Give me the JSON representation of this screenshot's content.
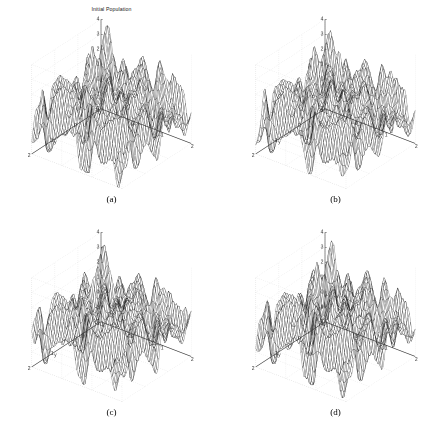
{
  "figure": {
    "background_color": "#ffffff",
    "layout": "2x2-grid",
    "width": 447,
    "height": 426
  },
  "panels": [
    {
      "key": "a",
      "caption": "(a)",
      "title": "Initial Population",
      "has_title": true,
      "seed": 11
    },
    {
      "key": "b",
      "caption": "(b)",
      "title": "",
      "has_title": false,
      "seed": 27
    },
    {
      "key": "c",
      "caption": "(c)",
      "title": "",
      "has_title": false,
      "seed": 43
    },
    {
      "key": "d",
      "caption": "(d)",
      "title": "",
      "has_title": false,
      "seed": 61
    }
  ],
  "chart_data": {
    "type": "line",
    "subtype": "3d-mesh-surface",
    "title": "Initial Population",
    "xlabel": "x",
    "ylabel": "y",
    "zlabel": "",
    "xlim": [
      -1,
      2
    ],
    "ylim": [
      -1,
      2
    ],
    "zlim": [
      -2,
      4
    ],
    "xticks": [
      -1,
      0,
      1,
      2
    ],
    "yticks": [
      -1,
      0,
      1,
      2
    ],
    "zticks": [
      -2,
      -1,
      0,
      1,
      2,
      3,
      4
    ],
    "xtick_labels": [
      "-1",
      "0",
      "1",
      "2"
    ],
    "ytick_labels": [
      "-1",
      "0",
      "1",
      "2"
    ],
    "ztick_labels": [
      "-2",
      "-1",
      "0",
      "1",
      "2",
      "3",
      "4"
    ],
    "grid": true,
    "grid_style": "dotted",
    "grid_color": "#c8c8c8",
    "legend": null,
    "mesh_color": "#000000",
    "surface_fill": "#ffffff",
    "axis_color": "#3a3a3a",
    "view_azimuth": -37.5,
    "view_elevation": 30,
    "mesh_resolution": 60,
    "panel_count": 4,
    "series": [
      {
        "name": "(a) initial population",
        "zmin": -2,
        "zmax": 4,
        "peak_count": 36
      },
      {
        "name": "(b) generation 2",
        "zmin": -2,
        "zmax": 4,
        "peak_count": 36
      },
      {
        "name": "(c) generation 3",
        "zmin": -2,
        "zmax": 4,
        "peak_count": 36
      },
      {
        "name": "(d) generation 4",
        "zmin": -2,
        "zmax": 4,
        "peak_count": 36
      }
    ]
  },
  "axis_style": {
    "tick_font_size": 5,
    "label_font_size": 5,
    "tick_color": "#2a2a2a"
  }
}
